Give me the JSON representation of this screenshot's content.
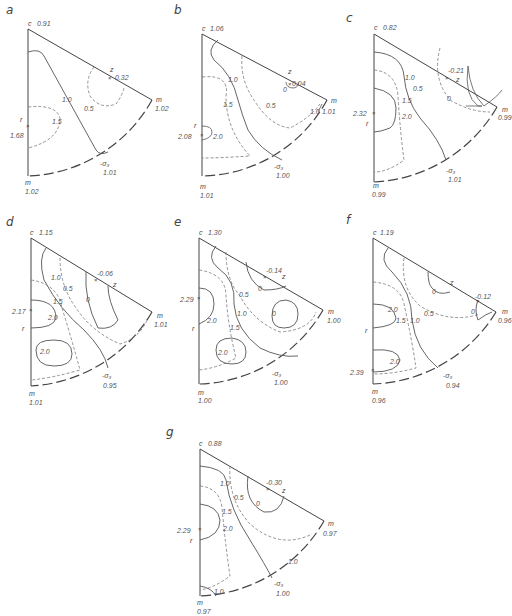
{
  "figure": {
    "panels": [
      {
        "id": "a",
        "c_value": "0.91",
        "z_value": "0.32",
        "m_right_value": "1.02",
        "r_value": "1.68",
        "sigma3_value": "1.01",
        "m_bottom_value": "1.02",
        "contours": [
          "1.0",
          "0.5",
          "1.5"
        ]
      },
      {
        "id": "b",
        "c_value": "1.06",
        "z_value": "0.04",
        "m_right_value": "1.01",
        "r_value": "2.08",
        "sigma3_value": "1.00",
        "m_bottom_value": "1.01",
        "contours": [
          "1.0",
          "0.5",
          "1.5",
          "2.0",
          "0",
          "1.0"
        ]
      },
      {
        "id": "c",
        "c_value": "0.82",
        "z_value": "-0.21",
        "m_right_value": "0.99",
        "r_value": "2.32",
        "sigma3_value": "1.01",
        "m_bottom_value": "0.99",
        "contours": [
          "1.0",
          "0.5",
          "1.5",
          "2.0",
          "0"
        ]
      },
      {
        "id": "d",
        "c_value": "1.15",
        "z_value": "-0.06",
        "m_right_value": "1.01",
        "r_value": "2.17",
        "sigma3_value": "0.95",
        "m_bottom_value": "1.01",
        "contours": [
          "1.0",
          "0.5",
          "1.5",
          "2.0",
          "0",
          "2.0"
        ]
      },
      {
        "id": "e",
        "c_value": "1.30",
        "z_value": "-0.14",
        "m_right_value": "1.00",
        "r_value": "2.29",
        "sigma3_value": "1.00",
        "m_bottom_value": "1.00",
        "contours": [
          "0",
          "0.5",
          "1.0",
          "1.5",
          "2.0",
          "0",
          "2.0"
        ]
      },
      {
        "id": "f",
        "c_value": "1.19",
        "z_value": "-0.12",
        "m_right_value": "0.96",
        "r_value": "2.39",
        "sigma3_value": "0.94",
        "m_bottom_value": "0.96",
        "contours": [
          "0",
          "0",
          "0.5",
          "1.0",
          "1.5",
          "2.0",
          "2.0"
        ]
      },
      {
        "id": "g",
        "c_value": "0.88",
        "z_value": "-0.30",
        "m_right_value": "0.97",
        "r_value": "2.29",
        "sigma3_value": "1.00",
        "m_bottom_value": "0.97",
        "contours": [
          "1.0",
          "0.5",
          "0",
          "1.5",
          "2.0",
          "1.0",
          "1.0"
        ]
      }
    ],
    "axis_labels": {
      "c": "c",
      "m": "m",
      "z": "z",
      "r": "r",
      "sigma": "-σ₃"
    }
  }
}
